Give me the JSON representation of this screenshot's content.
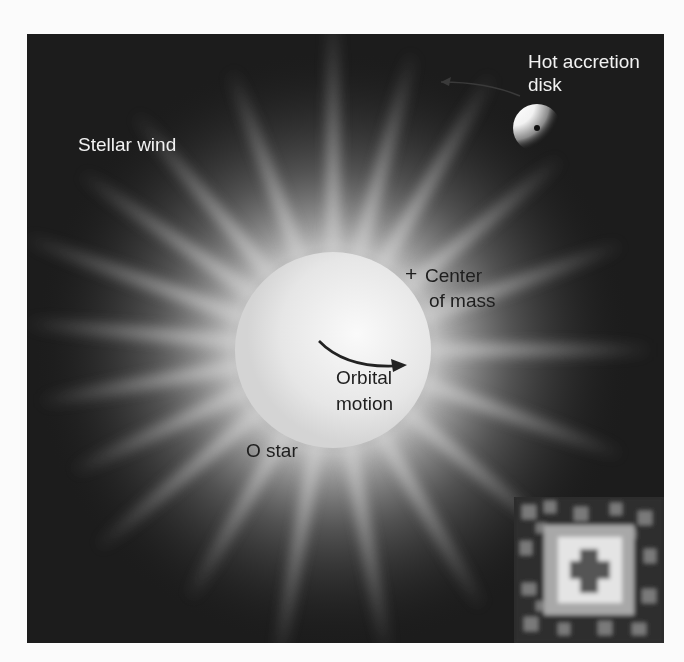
{
  "figure": {
    "colors": {
      "background": "#1c1c1c",
      "page": "#fbfbfb",
      "star_core": "#f4f4f4",
      "glow": "#bdbdbd",
      "light_text": "#f2f2f2",
      "dark_text": "#1e1e1e"
    }
  },
  "labels": {
    "stellar_wind": "Stellar wind",
    "hot_accretion_disk_line1": "Hot accretion",
    "hot_accretion_disk_line2": "disk",
    "center_of_mass_marker": "+",
    "center_of_mass_line1": "Center",
    "center_of_mass_line2": "of mass",
    "orbital_motion_line1": "Orbital",
    "orbital_motion_line2": "motion",
    "o_star": "O star"
  },
  "inset": {
    "description": "X-ray image of the accretion disk region (pixelated)"
  }
}
